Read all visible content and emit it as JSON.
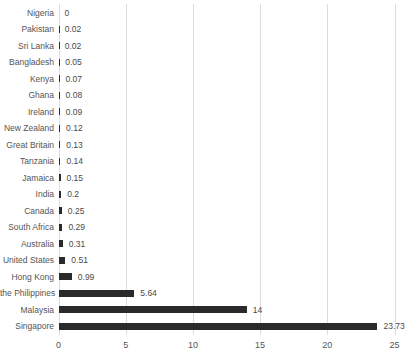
{
  "chart_data": {
    "type": "bar",
    "orientation": "horizontal",
    "title": "",
    "xlabel": "",
    "ylabel": "",
    "categories": [
      "Nigeria",
      "Pakistan",
      "Sri Lanka",
      "Bangladesh",
      "Kenya",
      "Ghana",
      "Ireland",
      "New Zealand",
      "Great Britain",
      "Tanzania",
      "Jamaica",
      "India",
      "Canada",
      "South Africa",
      "Australia",
      "United States",
      "Hong Kong",
      "the Philippines",
      "Malaysia",
      "Singapore"
    ],
    "values": [
      0,
      0.02,
      0.02,
      0.05,
      0.07,
      0.08,
      0.09,
      0.12,
      0.13,
      0.14,
      0.15,
      0.2,
      0.25,
      0.29,
      0.31,
      0.51,
      0.99,
      5.64,
      14,
      23.73
    ],
    "value_labels": [
      "0",
      "0.02",
      "0.02",
      "0.05",
      "0.07",
      "0.08",
      "0.09",
      "0.12",
      "0.13",
      "0.14",
      "0.15",
      "0.2",
      "0.25",
      "0.29",
      "0.31",
      "0.51",
      "0.99",
      "5.64",
      "14",
      "23.73"
    ],
    "xlim": [
      0,
      25
    ],
    "x_ticks": [
      "0",
      "5",
      "10",
      "15",
      "20",
      "25"
    ],
    "grid": true,
    "legend": false,
    "data_labels": "outside-end",
    "colors": {
      "bar": "#2a2a2a",
      "category_label": "#555555",
      "value_label": "#4a4a4a",
      "tick_label": "#555555",
      "gridline": "#dcdcdc",
      "background": "#ffffff"
    }
  }
}
